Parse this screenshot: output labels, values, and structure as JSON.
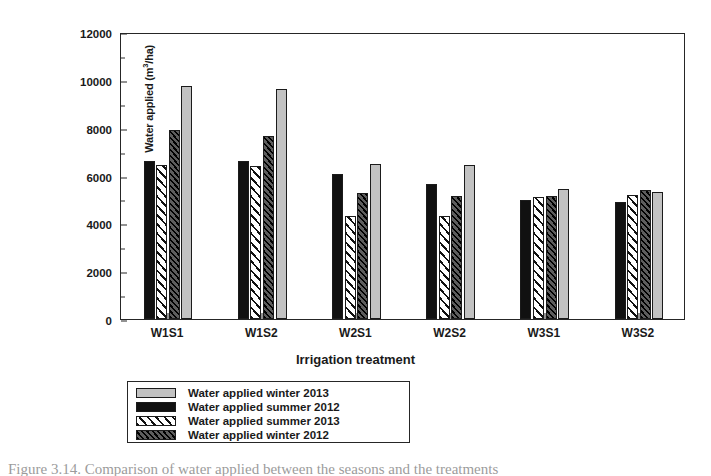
{
  "chart_data": {
    "type": "bar",
    "title": "",
    "xlabel": "Irrigation treatment",
    "ylabel": "Water applied (m3/ha)",
    "ylabel_html": "Water applied (m<sup>3</sup>/ha)",
    "ylim": [
      0,
      12000
    ],
    "ytick_step": 2000,
    "yticks": [
      0,
      2000,
      4000,
      6000,
      8000,
      10000,
      12000
    ],
    "grid": false,
    "legend_position": "below-axes",
    "categories": [
      "W1S1",
      "W1S2",
      "W2S1",
      "W2S2",
      "W3S1",
      "W3S2"
    ],
    "series": [
      {
        "name": "Water applied summer 2012",
        "pattern": "solid-black",
        "color": "#111111",
        "values": [
          6600,
          6600,
          6050,
          5650,
          4980,
          4900
        ]
      },
      {
        "name": "Water applied summer 2013",
        "pattern": "white-diagonal-stripes",
        "color": "#ffffff",
        "values": [
          6450,
          6400,
          4300,
          4300,
          5120,
          5200
        ]
      },
      {
        "name": "Water applied winter 2012",
        "pattern": "dark-diagonal-hatch",
        "color": "#2b2b2b",
        "values": [
          7900,
          7650,
          5250,
          5150,
          5150,
          5400
        ]
      },
      {
        "name": "Water applied winter 2013",
        "pattern": "solid-light-gray",
        "color": "#c2c2c2",
        "values": [
          9750,
          9620,
          6500,
          6450,
          5450,
          5300
        ]
      }
    ],
    "legend_order": [
      "Water applied winter 2013",
      "Water applied summer 2012",
      "Water applied summer 2013",
      "Water applied winter 2012"
    ]
  },
  "legend": {
    "items": [
      {
        "label": "Water applied winter 2013",
        "pattern": "solid-light-gray"
      },
      {
        "label": "Water applied summer 2012",
        "pattern": "solid-black"
      },
      {
        "label": "Water applied summer 2013",
        "pattern": "white-diagonal-stripes"
      },
      {
        "label": "Water applied winter 2012",
        "pattern": "dark-diagonal-hatch"
      }
    ]
  },
  "caption": "Figure 3.14. Comparison of water applied between the seasons and the treatments"
}
